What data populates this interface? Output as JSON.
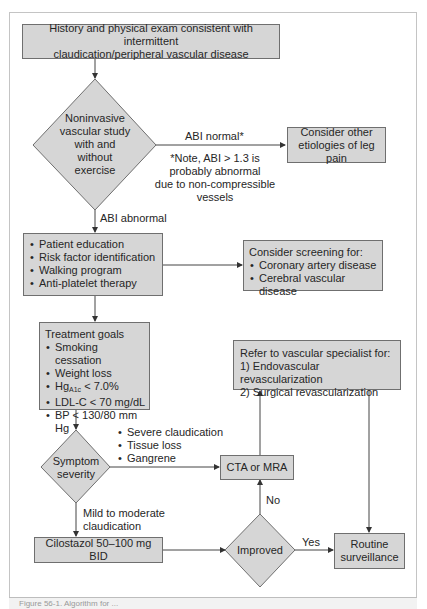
{
  "nodes": {
    "history": {
      "lines": [
        "History and physical exam consistent with intermittent",
        "claudication/peripheral vascular disease"
      ]
    },
    "noninvasive": {
      "lines": [
        "Noninvasive",
        "vascular study",
        "with and",
        "without",
        "exercise"
      ]
    },
    "other_etiologies": {
      "lines": [
        "Consider other",
        "etiologies of leg pain"
      ]
    },
    "initial_management": {
      "items": [
        "Patient education",
        "Risk factor identification",
        "Walking program",
        "Anti-platelet therapy"
      ]
    },
    "screening": {
      "title": "Consider screening for:",
      "items": [
        "Coronary artery disease",
        "Cerebral vascular disease"
      ]
    },
    "treatment_goals": {
      "title": "Treatment goals",
      "items": [
        "Smoking cessation",
        "Weight loss",
        "HgA1c < 7.0%",
        "LDL-C < 70 mg/dL",
        "BP < 130/80 mm Hg"
      ],
      "hba1c": {
        "prefix": "Hg",
        "sub": "A1c",
        "suffix": " < 7.0%"
      }
    },
    "refer": {
      "title": "Refer to vascular specialist for:",
      "items": [
        "1) Endovascular revascularization",
        "2) Surgical revascularization"
      ]
    },
    "symptom_severity": {
      "lines": [
        "Symptom",
        "severity"
      ]
    },
    "cta_mra": {
      "label": "CTA or MRA"
    },
    "cilostazol": {
      "label": "Cilostazol 50–100 mg BID"
    },
    "improved": {
      "label": "Improved"
    },
    "routine": {
      "lines": [
        "Routine",
        "surveillance"
      ]
    }
  },
  "edge_labels": {
    "abi_normal": "ABI normal*",
    "abi_note": [
      "*Note, ABI > 1.3 is",
      "probably abnormal",
      "due to non-compressible vessels"
    ],
    "abi_abnormal": "ABI abnormal",
    "severe_items": [
      "Severe claudication",
      "Tissue loss",
      "Gangrene"
    ],
    "mild": [
      "Mild to moderate",
      "claudication"
    ],
    "no": "No",
    "yes": "Yes"
  },
  "caption": "Figure 56-1. Algorithm for ..."
}
